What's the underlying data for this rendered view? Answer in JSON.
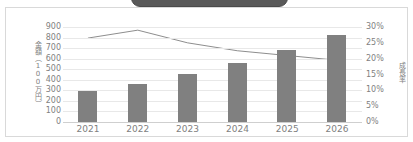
{
  "chart_data": {
    "type": "bar",
    "title": "",
    "subtitle": "",
    "xlabel": "",
    "ylabel": "金額（100万円）",
    "y2label": "成長率",
    "categories": [
      "2021",
      "2022",
      "2023",
      "2024",
      "2025",
      "2026"
    ],
    "series": [
      {
        "name": "金額（100万円）",
        "type": "bar",
        "axis": "left",
        "color": "#808080",
        "values": [
          290,
          360,
          455,
          555,
          680,
          820
        ]
      },
      {
        "name": "成長率",
        "type": "line",
        "axis": "right",
        "color": "#808080",
        "values": [
          26.5,
          29.0,
          25.0,
          22.5,
          21.0,
          19.5
        ]
      }
    ],
    "ylim": [
      0,
      900
    ],
    "yticks": [
      "0",
      "100",
      "200",
      "300",
      "400",
      "500",
      "600",
      "700",
      "800",
      "900"
    ],
    "y2lim": [
      0,
      30
    ],
    "y2ticks": [
      "0%",
      "5%",
      "10%",
      "15%",
      "20%",
      "25%",
      "30%"
    ],
    "grid": true,
    "legend": "none"
  },
  "banner": {
    "label": ""
  }
}
